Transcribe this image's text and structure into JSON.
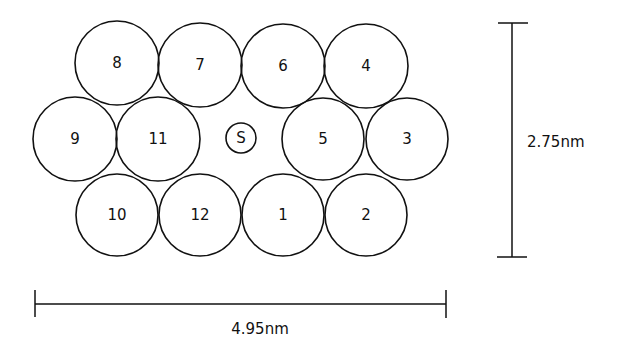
{
  "diagram": {
    "type": "subunit-packing",
    "subunits": [
      {
        "label": "8",
        "cx": 117,
        "cy": 63,
        "r": 42
      },
      {
        "label": "7",
        "cx": 200,
        "cy": 65,
        "r": 42
      },
      {
        "label": "6",
        "cx": 283,
        "cy": 66,
        "r": 42
      },
      {
        "label": "4",
        "cx": 366,
        "cy": 66,
        "r": 42
      },
      {
        "label": "9",
        "cx": 75,
        "cy": 139,
        "r": 42
      },
      {
        "label": "11",
        "cx": 158,
        "cy": 139,
        "r": 42
      },
      {
        "label": "5",
        "cx": 323,
        "cy": 139,
        "r": 41
      },
      {
        "label": "3",
        "cx": 407,
        "cy": 139,
        "r": 41
      },
      {
        "label": "10",
        "cx": 117,
        "cy": 215,
        "r": 41
      },
      {
        "label": "12",
        "cx": 200,
        "cy": 215,
        "r": 41
      },
      {
        "label": "1",
        "cx": 283,
        "cy": 215,
        "r": 41
      },
      {
        "label": "2",
        "cx": 366,
        "cy": 215,
        "r": 41
      }
    ],
    "center": {
      "label": "S",
      "cx": 241,
      "cy": 138,
      "r": 15
    },
    "scale_height": {
      "label": "2.75nm",
      "x": 512,
      "y1": 23,
      "y2": 257
    },
    "scale_width": {
      "label": "4.95nm",
      "y": 304,
      "x1": 35,
      "x2": 446
    }
  }
}
